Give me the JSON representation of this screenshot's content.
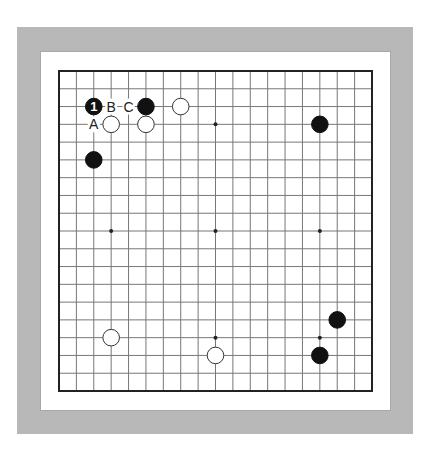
{
  "diagram": {
    "type": "go-board",
    "board_size": 19,
    "colors": {
      "frame_gray": "#b8b8b8",
      "inner_white": "#ffffff",
      "line": "#777777",
      "border": "#222222",
      "black_stone": "#111111",
      "white_stone": "#ffffff"
    },
    "star_points": [
      [
        3,
        3
      ],
      [
        9,
        3
      ],
      [
        15,
        3
      ],
      [
        3,
        9
      ],
      [
        9,
        9
      ],
      [
        15,
        9
      ],
      [
        3,
        15
      ],
      [
        9,
        15
      ],
      [
        15,
        15
      ]
    ],
    "stones": [
      {
        "color": "black",
        "col": 2,
        "row": 2,
        "label": "1"
      },
      {
        "color": "black",
        "col": 5,
        "row": 2,
        "label": ""
      },
      {
        "color": "white",
        "col": 7,
        "row": 2,
        "label": ""
      },
      {
        "color": "white",
        "col": 3,
        "row": 3,
        "label": ""
      },
      {
        "color": "white",
        "col": 5,
        "row": 3,
        "label": ""
      },
      {
        "color": "black",
        "col": 2,
        "row": 5,
        "label": ""
      },
      {
        "color": "black",
        "col": 15,
        "row": 3,
        "label": ""
      },
      {
        "color": "white",
        "col": 3,
        "row": 15,
        "label": ""
      },
      {
        "color": "white",
        "col": 9,
        "row": 16,
        "label": ""
      },
      {
        "color": "black",
        "col": 16,
        "row": 14,
        "label": ""
      },
      {
        "color": "black",
        "col": 15,
        "row": 16,
        "label": ""
      }
    ],
    "letter_marks": [
      {
        "text": "B",
        "col": 3,
        "row": 2
      },
      {
        "text": "C",
        "col": 4,
        "row": 2
      },
      {
        "text": "A",
        "col": 2,
        "row": 3
      }
    ]
  }
}
